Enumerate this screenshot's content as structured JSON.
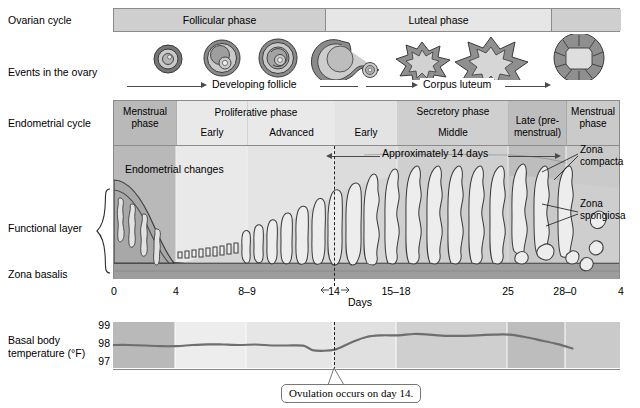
{
  "figure": {
    "row_labels": {
      "ovarian_cycle": "Ovarian cycle",
      "events_in_ovary": "Events in the ovary",
      "endometrial_cycle": "Endometrial cycle",
      "functional_layer": "Functional layer",
      "zona_basalis": "Zona basalis",
      "bbt": "Basal body\ntemperature (°F)"
    }
  },
  "ovarian_cycle": {
    "segments": [
      {
        "label": "Follicular phase",
        "start_day": 0,
        "end_day": 14
      },
      {
        "label": "Luteal phase",
        "start_day": 14,
        "end_day": 28
      },
      {
        "label": "",
        "start_day": 28,
        "end_day": 32
      }
    ]
  },
  "events_in_ovary": {
    "arrows": [
      {
        "label": "Developing follicle"
      },
      {
        "label": "Corpus luteum"
      }
    ],
    "structures": [
      "primordial-follicle",
      "primary-follicle",
      "secondary-follicle",
      "graafian-follicle-ovulation",
      "early-corpus-luteum",
      "mature-corpus-luteum",
      "corpus-luteum-regressing"
    ]
  },
  "endometrial_cycle": {
    "columns": [
      {
        "title": "Menstrual\nphase",
        "sub": "",
        "start_day": 0,
        "end_day": 4,
        "shade": "dark"
      },
      {
        "title": "Proliferative phase",
        "sub": "Early",
        "start_day": 4,
        "end_day": 8.5,
        "shade": "light"
      },
      {
        "title": "",
        "sub": "Advanced",
        "start_day": 8.5,
        "end_day": 14,
        "shade": "light"
      },
      {
        "title": "",
        "sub": "Early",
        "start_day": 14,
        "end_day": 18,
        "shade": "light"
      },
      {
        "title": "Secretory phase",
        "sub": "Middle",
        "start_day": 18,
        "end_day": 25,
        "shade": "mid"
      },
      {
        "title": "Late (pre-\nmenstrual)",
        "sub": "",
        "start_day": 25,
        "end_day": 28,
        "shade": "dark"
      },
      {
        "title": "Menstrual\nphase",
        "sub": "",
        "start_day": 28,
        "end_day": 32,
        "shade": "mid"
      }
    ],
    "group_headers": [
      "Proliferative phase",
      "Secretory phase"
    ],
    "annotation": "Endometrial changes",
    "span_arrow_label": "Approximately 14 days",
    "callouts": [
      {
        "label": "Zona\ncompacta"
      },
      {
        "label": "Zona\nspongiosa"
      }
    ]
  },
  "days_axis": {
    "label": "Days",
    "ticks": [
      "0",
      "4",
      "8–9",
      "14",
      "15–18",
      "25",
      "28–0",
      "4"
    ],
    "tick_days": [
      0,
      4,
      8.5,
      14,
      16.5,
      25,
      29,
      32
    ]
  },
  "chart_data": {
    "type": "line",
    "title": "Basal body temperature (°F)",
    "xlabel": "Days",
    "ylabel": "Basal body temperature (°F)",
    "ylim": [
      97,
      99
    ],
    "yticks": [
      "97",
      "98",
      "99"
    ],
    "xlim": [
      0,
      32
    ],
    "grid": false,
    "legend": "none",
    "annotation": "Ovulation occurs on day 14.",
    "series": [
      {
        "name": "Basal body temperature",
        "x": [
          0,
          1,
          2,
          3,
          4,
          5,
          6,
          7,
          8,
          9,
          10,
          11,
          12,
          12.6,
          13.2,
          14,
          15,
          16,
          17,
          18,
          19,
          20,
          21,
          22,
          23,
          24,
          25,
          26,
          27,
          28,
          29
        ],
        "y": [
          98.0,
          98.0,
          97.98,
          97.95,
          97.95,
          98.0,
          98.03,
          98.02,
          98.0,
          98.02,
          97.98,
          97.98,
          97.97,
          97.78,
          97.75,
          97.8,
          98.1,
          98.35,
          98.42,
          98.42,
          98.48,
          98.45,
          98.4,
          98.4,
          98.42,
          98.45,
          98.45,
          98.35,
          98.2,
          98.05,
          97.85
        ]
      }
    ]
  }
}
